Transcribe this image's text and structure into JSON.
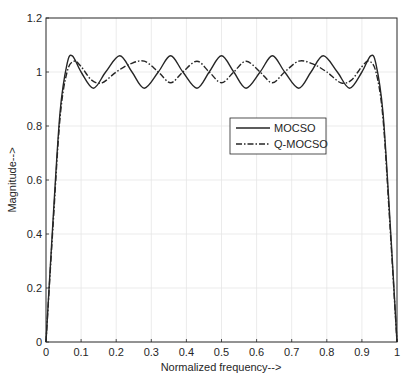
{
  "chart_data": {
    "type": "line",
    "title": "",
    "xlabel": "Normalized frequency-->",
    "ylabel": "Magnitude-->",
    "xlim": [
      0,
      1
    ],
    "ylim": [
      0,
      1.2
    ],
    "grid": true,
    "legend_position": "center-right",
    "xticks": [
      "0",
      "0.1",
      "0.2",
      "0.3",
      "0.4",
      "0.5",
      "0.6",
      "0.7",
      "0.8",
      "0.9",
      "1"
    ],
    "yticks": [
      "0",
      "0.2",
      "0.4",
      "0.6",
      "0.8",
      "1",
      "1.2"
    ],
    "series": [
      {
        "name": "MOCSO",
        "style": "solid",
        "x": [
          0,
          0.02,
          0.04,
          0.06,
          0.075,
          0.1,
          0.135,
          0.17,
          0.21,
          0.245,
          0.28,
          0.32,
          0.355,
          0.39,
          0.43,
          0.465,
          0.5,
          0.535,
          0.57,
          0.61,
          0.645,
          0.68,
          0.72,
          0.755,
          0.79,
          0.83,
          0.865,
          0.9,
          0.925,
          0.94,
          0.96,
          0.98,
          1
        ],
        "values": [
          0,
          0.45,
          0.85,
          1.03,
          1.06,
          1.0,
          0.94,
          1.0,
          1.06,
          1.0,
          0.94,
          1.0,
          1.06,
          1.0,
          0.94,
          1.0,
          1.06,
          1.0,
          0.94,
          1.0,
          1.06,
          1.0,
          0.94,
          1.0,
          1.06,
          1.0,
          0.94,
          1.0,
          1.06,
          1.03,
          0.85,
          0.45,
          0
        ]
      },
      {
        "name": "Q-MOCSO",
        "style": "dash-dot",
        "x": [
          0,
          0.02,
          0.04,
          0.06,
          0.08,
          0.1,
          0.13,
          0.16,
          0.2,
          0.24,
          0.28,
          0.32,
          0.355,
          0.39,
          0.43,
          0.465,
          0.5,
          0.535,
          0.57,
          0.61,
          0.645,
          0.68,
          0.72,
          0.76,
          0.8,
          0.84,
          0.87,
          0.9,
          0.92,
          0.94,
          0.96,
          0.98,
          1
        ],
        "values": [
          0,
          0.43,
          0.83,
          1.0,
          1.04,
          1.02,
          0.97,
          0.96,
          1.0,
          1.03,
          1.04,
          1.0,
          0.96,
          1.0,
          1.04,
          1.0,
          0.96,
          1.0,
          1.04,
          1.0,
          0.96,
          1.0,
          1.04,
          1.03,
          1.0,
          0.96,
          0.97,
          1.02,
          1.04,
          1.0,
          0.83,
          0.43,
          0
        ]
      }
    ]
  }
}
